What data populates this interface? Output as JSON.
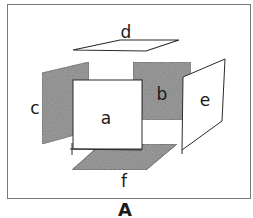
{
  "diagram": {
    "caption": "A",
    "colors": {
      "background": "#ffffff",
      "line": "#2a2a2a",
      "frame": "#7a7a7a",
      "shaded": "#8c8c8c",
      "unshaded": "#ffffff"
    },
    "faces": {
      "a": {
        "label": "a",
        "position": "front",
        "shaded": false
      },
      "b": {
        "label": "b",
        "position": "back",
        "shaded": true
      },
      "c": {
        "label": "c",
        "position": "left",
        "shaded": true
      },
      "d": {
        "label": "d",
        "position": "top",
        "shaded": false
      },
      "e": {
        "label": "e",
        "position": "right",
        "shaded": false
      },
      "f": {
        "label": "f",
        "position": "bottom",
        "shaded": true
      }
    }
  }
}
